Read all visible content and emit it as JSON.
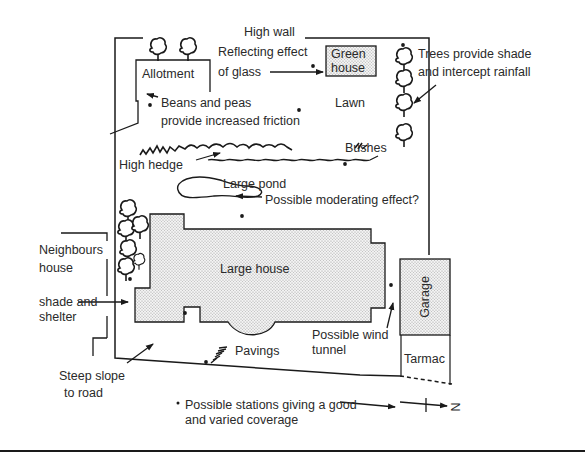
{
  "diagram": {
    "title": "",
    "labels": {
      "high_wall": "High wall",
      "reflecting_1": "Reflecting effect",
      "reflecting_2": "of glass",
      "greenhouse_1": "Green",
      "greenhouse_2": "house",
      "allotment": "Allotment",
      "trees_1": "Trees provide shade",
      "trees_2": "and intercept rainfall",
      "beans_1": "Beans and peas",
      "beans_2": "provide increased friction",
      "lawn": "Lawn",
      "bushes": "Bushes",
      "high_hedge": "High hedge",
      "large_pond": "Large pond",
      "moderating": "Possible moderating effect?",
      "neighbours_1": "Neighbours",
      "neighbours_2": "house",
      "shade_1": "shade and",
      "shade_2": "shelter",
      "large_house": "Large house",
      "garage": "Garage",
      "wind_1": "Possible wind",
      "wind_2": "tunnel",
      "pavings": "Pavings",
      "tarmac": "Tarmac",
      "slope_1": "Steep slope",
      "slope_2": "to road",
      "legend_1": "Possible stations giving a good",
      "legend_2": "and varied coverage",
      "north": "N"
    },
    "legend": {
      "marker": "•",
      "meaning": "Possible stations giving a good and varied coverage"
    },
    "colors": {
      "ink": "#1a1a1a",
      "text": "#2a2a2a",
      "stipple_fill": "#d9d9d9",
      "background": "#ffffff"
    },
    "stations": [
      {
        "x": 313,
        "y": 38
      },
      {
        "x": 150,
        "y": 105
      },
      {
        "x": 299,
        "y": 110
      },
      {
        "x": 403,
        "y": 45
      },
      {
        "x": 345,
        "y": 163
      },
      {
        "x": 242,
        "y": 216
      },
      {
        "x": 130,
        "y": 279
      },
      {
        "x": 185,
        "y": 313
      },
      {
        "x": 391,
        "y": 285
      },
      {
        "x": 206,
        "y": 362
      }
    ]
  }
}
